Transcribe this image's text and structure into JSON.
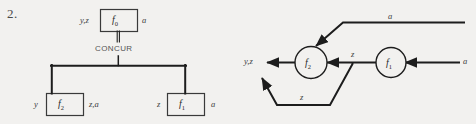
{
  "figure": {
    "number": "2.",
    "caption_left": "CONCUR",
    "left_diagram": {
      "name": "task-decomposition-tree",
      "root": {
        "node": "f",
        "subscript": "0",
        "inputs": "y,z",
        "outputs": "a"
      },
      "connector_label": "CONCUR",
      "children": [
        {
          "node": "f",
          "subscript": "2",
          "inputs": "y",
          "outputs": "z,a"
        },
        {
          "node": "f",
          "subscript": "1",
          "inputs": "z",
          "outputs": "a"
        }
      ]
    },
    "right_diagram": {
      "name": "dataflow-graph",
      "nodes": [
        {
          "node": "f",
          "subscript": "2"
        },
        {
          "node": "f",
          "subscript": "1"
        }
      ],
      "edges": [
        {
          "label": "a",
          "name": "edge-a-top"
        },
        {
          "label": "a",
          "name": "edge-a-right"
        },
        {
          "label": "z",
          "name": "edge-z-middle"
        },
        {
          "label": "z",
          "name": "edge-z-feedback"
        }
      ],
      "output_label": "y,z"
    }
  },
  "colors": {
    "stroke": "#1d1d1d",
    "background": "#f2f1ef",
    "text": "#3c3c3c"
  }
}
